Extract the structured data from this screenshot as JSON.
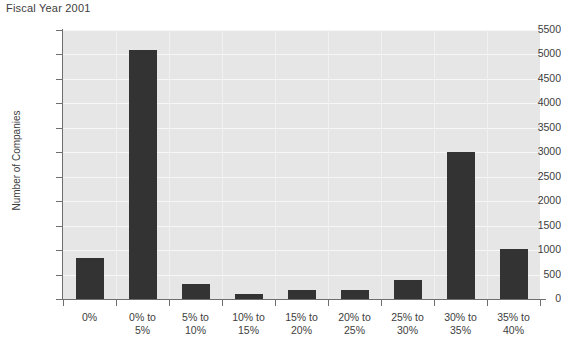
{
  "chart_data": {
    "type": "bar",
    "title": "Fiscal Year 2001",
    "xlabel": "",
    "ylabel": "Number of Companies",
    "categories": [
      "0%",
      "0% to\n5%",
      "5% to\n10%",
      "10% to\n15%",
      "15% to\n20%",
      "20% to\n25%",
      "25% to\n30%",
      "30% to\n35%",
      "35% to\n40%"
    ],
    "values": [
      840,
      5100,
      300,
      100,
      180,
      180,
      380,
      3000,
      1020
    ],
    "ylim": [
      0,
      5500
    ],
    "ytick_step": 500,
    "ytick_labels": [
      "0",
      "500",
      "1000",
      "1500",
      "2000",
      "2500",
      "3000",
      "3500",
      "4000",
      "4500",
      "5000",
      "5500"
    ],
    "grid": true,
    "legend": null,
    "bar_color": "#333333",
    "plot_background": "#e6e6e6",
    "gridline_color": "#f7f7f7",
    "axis_color": "#6e6e6e",
    "text_color": "#3d3d3d"
  }
}
